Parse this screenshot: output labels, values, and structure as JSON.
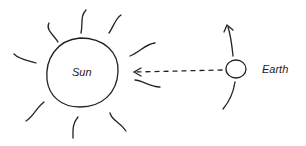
{
  "diagram": {
    "labels": {
      "sun": "Sun",
      "earth": "Earth"
    },
    "elements": {
      "sun": {
        "shape": "circle",
        "rays": 8
      },
      "earth": {
        "shape": "circle"
      },
      "light_path": {
        "style": "dashed-arrow",
        "direction": "earth-to-sun"
      },
      "orbit": {
        "style": "arc-arrow",
        "direction": "up"
      }
    },
    "colors": {
      "stroke": "#222222",
      "background": "#ffffff"
    }
  }
}
